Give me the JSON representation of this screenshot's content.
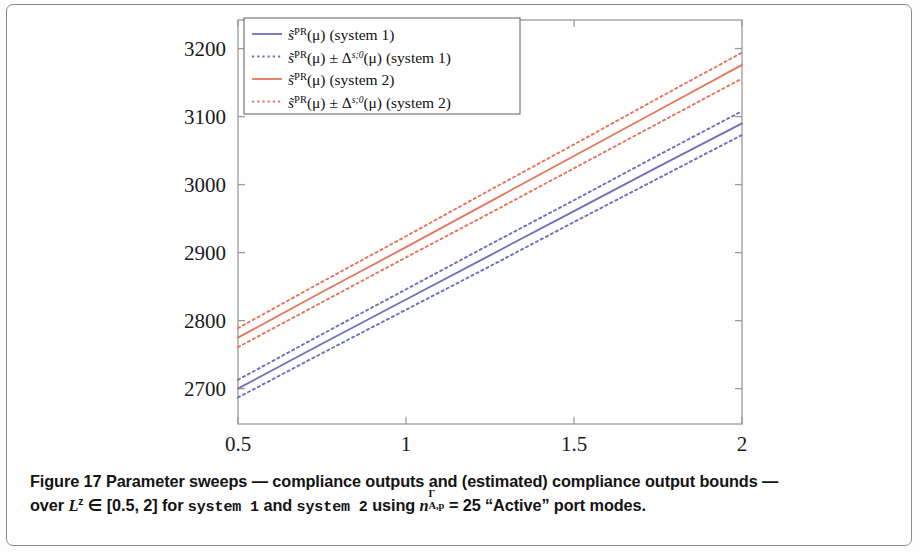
{
  "figure": {
    "caption_line1": "Figure 17 Parameter sweeps — compliance outputs and (estimated) compliance output bounds —",
    "caption_prefix": "over ",
    "caption_Lz": "L",
    "caption_Lz_sup": "z",
    "caption_range": " ∈ [0.5, 2] for ",
    "caption_system1": "system 1",
    "caption_and": " and ",
    "caption_system2": "system 2",
    "caption_using": " using ",
    "caption_n": "n",
    "caption_n_sup": "Γ",
    "caption_n_sub": "A,p",
    "caption_eq": " = 25 “Active” port modes.",
    "figure_number": "Figure 17"
  },
  "chart_data": {
    "type": "line",
    "title": "",
    "xlabel": "L",
    "ylabel": "",
    "xlim": [
      0.5,
      2
    ],
    "ylim": [
      2648,
      3242
    ],
    "xticks": [
      0.5,
      1,
      1.5,
      2
    ],
    "xticklabels": [
      "0.5",
      "1",
      "1.5",
      "2"
    ],
    "yticks": [
      2700,
      2800,
      2900,
      3000,
      3100,
      3200
    ],
    "yticklabels": [
      "2700",
      "2800",
      "2900",
      "3000",
      "3100",
      "3200"
    ],
    "grid": false,
    "legend_position": "top-left",
    "colors": {
      "system1": "#6f6fbe",
      "system2": "#e2775c",
      "axis": "#9a9a9a",
      "text": "#1a1a1a"
    },
    "series": [
      {
        "name": "s̃PR(μ) (system 1)",
        "legend_label": "system 1 compliance output",
        "color": "#6f6fbe",
        "style": "solid",
        "x": [
          0.5,
          0.75,
          1.0,
          1.25,
          1.5,
          1.75,
          2.0
        ],
        "values": [
          2700,
          2766,
          2831,
          2896,
          2961,
          3026,
          3090
        ]
      },
      {
        "name": "s̃PR(μ) + Δs;0(μ) (system 1 upper)",
        "legend_label": "system 1 upper bound",
        "color": "#6f6fbe",
        "style": "dotted",
        "x": [
          0.5,
          0.75,
          1.0,
          1.25,
          1.5,
          1.75,
          2.0
        ],
        "values": [
          2713,
          2780,
          2846,
          2912,
          2977,
          3043,
          3108
        ]
      },
      {
        "name": "s̃PR(μ) − Δs;0(μ) (system 1 lower)",
        "legend_label": "system 1 lower bound",
        "color": "#6f6fbe",
        "style": "dotted",
        "x": [
          0.5,
          0.75,
          1.0,
          1.25,
          1.5,
          1.75,
          2.0
        ],
        "values": [
          2687,
          2752,
          2816,
          2880,
          2945,
          3009,
          3073
        ]
      },
      {
        "name": "s̃PR(μ) (system 2)",
        "legend_label": "system 2 compliance output",
        "color": "#e2775c",
        "style": "solid",
        "x": [
          0.5,
          0.75,
          1.0,
          1.25,
          1.5,
          1.75,
          2.0
        ],
        "values": [
          2775,
          2842,
          2908,
          2975,
          3042,
          3109,
          3176
        ]
      },
      {
        "name": "s̃PR(μ) + Δs;0(μ) (system 2 upper)",
        "legend_label": "system 2 upper bound",
        "color": "#e2775c",
        "style": "dotted",
        "x": [
          0.5,
          0.75,
          1.0,
          1.25,
          1.5,
          1.75,
          2.0
        ],
        "values": [
          2789,
          2857,
          2924,
          2992,
          3059,
          3127,
          3194
        ]
      },
      {
        "name": "s̃PR(μ) − Δs;0(μ) (system 2 lower)",
        "legend_label": "system 2 lower bound",
        "color": "#e2775c",
        "style": "dotted",
        "x": [
          0.5,
          0.75,
          1.0,
          1.25,
          1.5,
          1.75,
          2.0
        ],
        "values": [
          2761,
          2827,
          2893,
          2958,
          3024,
          3090,
          3156
        ]
      }
    ],
    "legend_entries": [
      {
        "swatch_color": "#6f6fbe",
        "swatch_style": "solid",
        "label_parts": {
          "s": "s̃",
          "sup": "PR",
          "arg": "(μ)",
          "pm": "",
          "delta": "",
          "tail": "(system 1)"
        }
      },
      {
        "swatch_color": "#6f6fbe",
        "swatch_style": "dotted",
        "label_parts": {
          "s": "s̃",
          "sup": "PR",
          "arg": "(μ)",
          "pm": " ± ",
          "delta": "Δ",
          "delta_sup": "s;0",
          "arg2": "(μ)",
          "tail": "(system 1)"
        }
      },
      {
        "swatch_color": "#e2775c",
        "swatch_style": "solid",
        "label_parts": {
          "s": "s̃",
          "sup": "PR",
          "arg": "(μ)",
          "pm": "",
          "delta": "",
          "tail": "(system 2)"
        }
      },
      {
        "swatch_color": "#e2775c",
        "swatch_style": "dotted",
        "label_parts": {
          "s": "s̃",
          "sup": "PR",
          "arg": "(μ)",
          "pm": " ± ",
          "delta": "Δ",
          "delta_sup": "s;0",
          "arg2": "(μ)",
          "tail": "(system 2)"
        }
      }
    ]
  }
}
